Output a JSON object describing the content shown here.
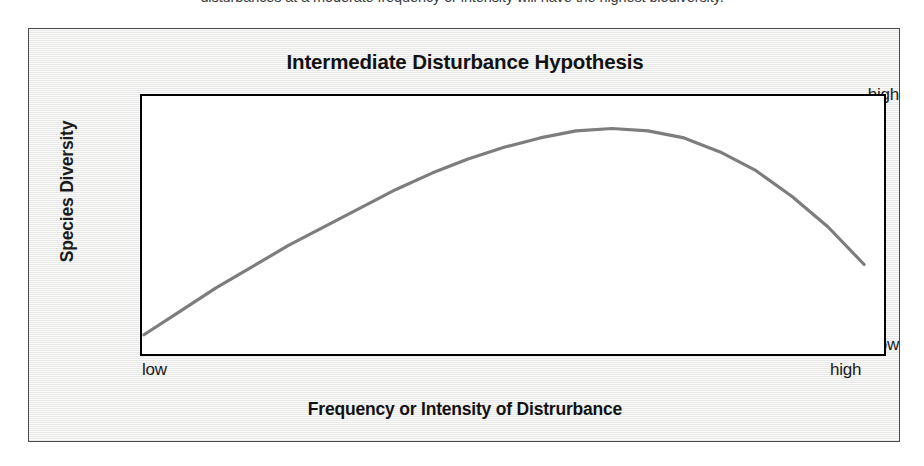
{
  "page": {
    "caption_above_figure": "disturbances at a moderate frequency or intensity will have the highest biodiversity."
  },
  "figure": {
    "title": "Intermediate Disturbance Hypothesis",
    "y_axis": {
      "title": "Species Diversity",
      "tick_high": "high",
      "tick_low": "low"
    },
    "x_axis": {
      "title": "Frequency or Intensity of Distrurbance",
      "tick_low": "low",
      "tick_high": "high"
    }
  },
  "chart_data": {
    "type": "line",
    "title": "Intermediate Disturbance Hypothesis",
    "xlabel": "Frequency or Intensity of Distrurbance",
    "ylabel": "Species Diversity",
    "xlim": [
      0,
      100
    ],
    "ylim": [
      0,
      100
    ],
    "xtick_labels": [
      "low",
      "high"
    ],
    "ytick_labels": [
      "low",
      "high"
    ],
    "grid": false,
    "legend": "none",
    "line_color": "#7d7d7d",
    "line_width": 3,
    "series": [
      {
        "name": "Species diversity vs disturbance",
        "x": [
          0,
          5,
          10,
          15,
          20,
          25,
          30,
          35,
          40,
          45,
          50,
          55,
          60,
          65,
          70,
          75,
          80,
          85,
          90,
          95,
          100
        ],
        "y": [
          4,
          14,
          24,
          33,
          42,
          50,
          58,
          66,
          73,
          79,
          84,
          88,
          91,
          92,
          91,
          88,
          82,
          74,
          63,
          50,
          34
        ]
      }
    ],
    "peak": {
      "x": 45,
      "y": 92
    },
    "annotation": "Unimodal (hump-shaped) curve: diversity is lowest at low and high disturbance, highest at intermediate disturbance."
  }
}
